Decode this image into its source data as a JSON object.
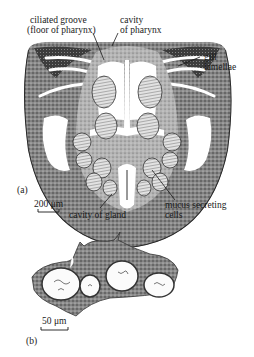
{
  "figure": {
    "panel_a": {
      "tag": "(a)",
      "labels": {
        "ciliated_groove_line1": "ciliated groove",
        "ciliated_groove_line2": "(floor of pharynx)",
        "cavity_pharynx_line1": "cavity",
        "cavity_pharynx_line2": "of pharynx",
        "gill_line1": "gill",
        "gill_line2": "lamellae",
        "mucus_line1": "mucus secreting",
        "mucus_line2": "cells",
        "cavity_gland": "cavity of gland"
      },
      "scale_bar": "200 μm"
    },
    "panel_b": {
      "tag": "(b)",
      "scale_bar": "50 μm"
    }
  },
  "colors": {
    "ink": "#1a1a1a",
    "tissue_dark": "#3a3a3a",
    "tissue_mid": "#7a7a7a",
    "tissue_light": "#b8b8b8",
    "background": "#ffffff"
  }
}
